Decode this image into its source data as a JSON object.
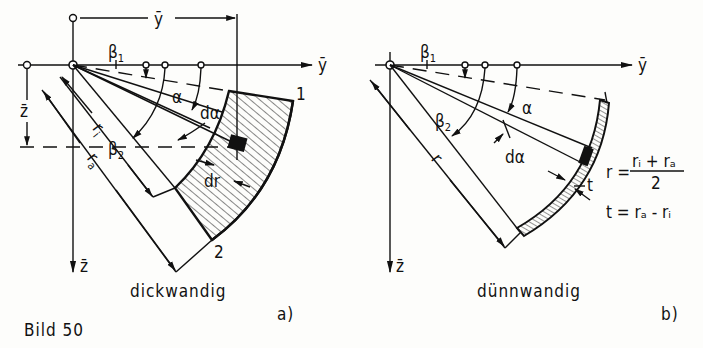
{
  "figure": {
    "caption": "Bild 50",
    "background": "#fdfdfb",
    "ink": "#111111"
  },
  "panel_a": {
    "title": "dickwandig",
    "tag": "a)",
    "labels": {
      "y_axis": "ȳ",
      "z_axis": "z̄",
      "y_dim": "ȳ",
      "z_dim": "z̄",
      "beta1": "β",
      "beta1_sub": "1",
      "beta2": "β",
      "beta2_sub": "2",
      "alpha": "α",
      "d_alpha": "dα",
      "r_i": "r",
      "r_i_sub": "i",
      "r_a": "r",
      "r_a_sub": "a",
      "dr": "dr",
      "point1": "1",
      "point2": "2"
    }
  },
  "panel_b": {
    "title": "dünnwandig",
    "tag": "b)",
    "labels": {
      "y_axis": "ȳ",
      "z_axis": "z̄",
      "beta1": "β",
      "beta1_sub": "1",
      "beta2": "β",
      "beta2_sub": "2",
      "alpha": "α",
      "d_alpha": "dα",
      "r": "r",
      "t": "t"
    },
    "formulas": {
      "r_lhs": "r =",
      "r_num": "rᵢ + rₐ",
      "r_den": "2",
      "t_eq": "t = rₐ - rᵢ"
    }
  }
}
